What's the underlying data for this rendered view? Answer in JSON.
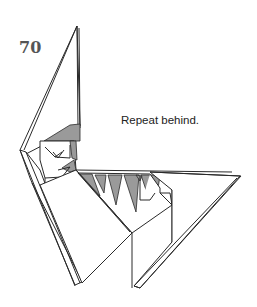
{
  "step": {
    "number": "70"
  },
  "instruction": {
    "text": "Repeat behind."
  },
  "colors": {
    "line": "#2a2a2a",
    "shade": "#9a9a9a",
    "paper": "#ffffff"
  }
}
